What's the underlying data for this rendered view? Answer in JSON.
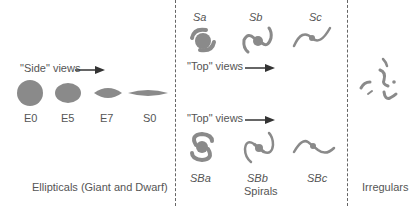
{
  "sections": {
    "ellipticals": {
      "title": "Ellipticals (Giant and Dwarf)",
      "side_views_label": "\"Side\" views",
      "types": [
        "E0",
        "E5",
        "E7",
        "S0"
      ]
    },
    "spirals": {
      "title": "Spirals",
      "top_views_label_1": "\"Top\" views",
      "top_views_label_2": "\"Top\" views",
      "normal_types": [
        "Sa",
        "Sb",
        "Sc"
      ],
      "barred_types": [
        "SBa",
        "SBb",
        "SBc"
      ]
    },
    "irregulars": {
      "title": "Irregulars"
    }
  },
  "colors": {
    "galaxy_fill": "#8a8a8a",
    "divider": "#666666",
    "text": "#555555"
  }
}
